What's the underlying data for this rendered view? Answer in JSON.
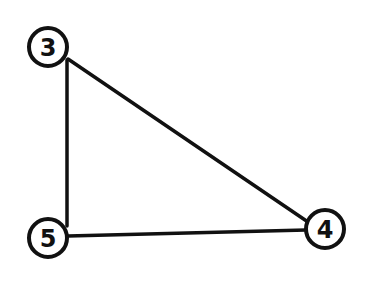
{
  "diagram": {
    "type": "graph",
    "background": "#ffffff",
    "stroke_color": "#111111",
    "nodes": [
      {
        "id": "n3",
        "label": "3",
        "cx": 48,
        "cy": 47,
        "r": 19
      },
      {
        "id": "n5",
        "label": "5",
        "cx": 48,
        "cy": 238,
        "r": 19
      },
      {
        "id": "n4",
        "label": "4",
        "cx": 325,
        "cy": 229,
        "r": 19
      }
    ],
    "edges": [
      {
        "from": "3",
        "to": "5",
        "x1": 67,
        "y1": 60,
        "x2": 67,
        "y2": 226
      },
      {
        "from": "3",
        "to": "4",
        "x1": 68,
        "y1": 59,
        "x2": 308,
        "y2": 222
      },
      {
        "from": "5",
        "to": "4",
        "x1": 68,
        "y1": 236,
        "x2": 306,
        "y2": 230
      }
    ]
  }
}
